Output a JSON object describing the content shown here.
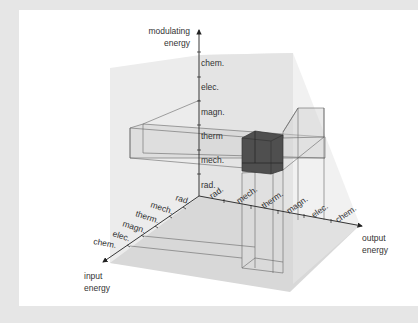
{
  "axes": {
    "modulating": {
      "title_line1": "modulating",
      "title_line2": "energy"
    },
    "output": {
      "title_line1": "output",
      "title_line2": "energy"
    },
    "input": {
      "title_line1": "input",
      "title_line2": "energy"
    }
  },
  "categories": [
    "rad.",
    "mech.",
    "therm",
    "magn.",
    "elec.",
    "chem."
  ],
  "vertical_ticks": [
    "rad.",
    "mech.",
    "therm",
    "magn.",
    "elec.",
    "chem."
  ],
  "output_ticks": [
    "rad.",
    "mech.",
    "therm.",
    "magn.",
    "elec.",
    "chem."
  ],
  "input_ticks": [
    "rad.",
    "mech.",
    "therm.",
    "magn.",
    "elec.",
    "chem."
  ],
  "highlight": {
    "input": "therm.",
    "output": "therm.",
    "modulating": "mech.",
    "color": "#555555"
  },
  "colors": {
    "background": "#e6e6e6",
    "panel": "#ffffff",
    "cube_shade": "#d9d9d9",
    "line": "#555555"
  }
}
